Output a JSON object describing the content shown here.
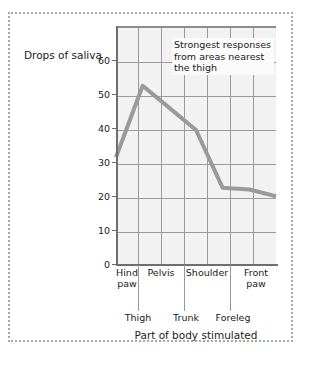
{
  "chart_data": {
    "type": "line",
    "title": "",
    "xlabel": "Part of body stimulated",
    "ylabel": "Drops of saliva",
    "ylim": [
      0,
      70
    ],
    "yticks": [
      0,
      10,
      20,
      30,
      40,
      50,
      60
    ],
    "grid": true,
    "legend": null,
    "categories": [
      "Hind paw",
      "Thigh",
      "Pelvis",
      "Trunk",
      "Shoulder",
      "Foreleg",
      "Front paw"
    ],
    "values": [
      32,
      53,
      46.5,
      40,
      23,
      22.5,
      20.5
    ],
    "points": [
      {
        "category": "Hind paw",
        "value": 32
      },
      {
        "category": "Thigh",
        "value": 53
      },
      {
        "category": "Pelvis",
        "value": 46.5
      },
      {
        "category": "Trunk",
        "value": 40
      },
      {
        "category": "Shoulder",
        "value": 23
      },
      {
        "category": "Foreleg",
        "value": 22.5
      },
      {
        "category": "Front paw",
        "value": 20.5
      }
    ],
    "x_labels_top": [
      "Hind paw",
      "Pelvis",
      "Shoulder",
      "Front paw"
    ],
    "x_labels_bottom": [
      "Thigh",
      "Trunk",
      "Foreleg"
    ],
    "annotations": [
      {
        "text": "Strongest responses from areas nearest the thigh"
      }
    ],
    "colors": {
      "line": "#9a9a9a",
      "plot_background": "#f2f2f2",
      "grid": "#9a9a9a",
      "axis": "#6f6f6f",
      "text": "#1a1a1a",
      "page_border": "#a8a8a8"
    }
  },
  "axis": {
    "y_title": "Drops of saliva",
    "x_title": "Part of body stimulated",
    "y_ticks": [
      "60",
      "50",
      "40",
      "30",
      "20",
      "10",
      "0"
    ]
  },
  "annotation": {
    "line1": "Strongest responses",
    "line2": "from areas nearest",
    "line3": "the thigh"
  },
  "x_labels": {
    "top": [
      "Hind",
      "paw",
      "Pelvis",
      "Shoulder",
      "Front",
      "paw"
    ],
    "hind_paw_1": "Hind",
    "hind_paw_2": "paw",
    "pelvis": "Pelvis",
    "shoulder": "Shoulder",
    "front_paw_1": "Front",
    "front_paw_2": "paw",
    "thigh": "Thigh",
    "trunk": "Trunk",
    "foreleg": "Foreleg"
  }
}
